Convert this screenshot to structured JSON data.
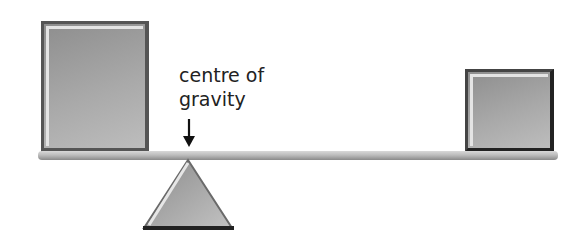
{
  "diagram": {
    "label": {
      "line1": "centre of",
      "line2": "gravity"
    },
    "elements": {
      "large_weight": "large square weight on left end of beam",
      "small_weight": "small square weight on right end of beam",
      "beam": "horizontal lever beam",
      "fulcrum": "triangular pivot under beam",
      "arrow": "downward arrow pointing to centre of gravity above fulcrum"
    },
    "colors": {
      "box_fill": "#a9a9a9",
      "box_border": "#555555",
      "beam": "#bdbdbd",
      "text": "#222222"
    }
  }
}
